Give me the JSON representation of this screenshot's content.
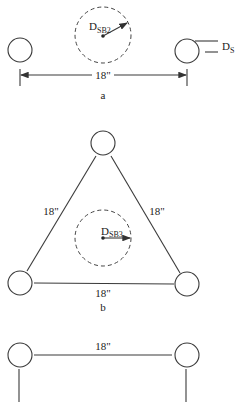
{
  "diagram": {
    "type": "conductor bundle geometry",
    "panels": [
      {
        "id": "a",
        "label": "a",
        "description": "2-conductor bundle",
        "spacing_label": "18\"",
        "gmr_label_main": "D",
        "gmr_label_sub": "SB2",
        "conductor_label_main": "D",
        "conductor_label_sub": "S"
      },
      {
        "id": "b",
        "label": "b",
        "description": "3-conductor bundle (equilateral triangle)",
        "side_labels": [
          "18\"",
          "18\"",
          "18\""
        ],
        "gmr_label_main": "D",
        "gmr_label_sub": "SB3"
      },
      {
        "id": "c",
        "description": "4-conductor bundle (square, partially visible)",
        "top_label": "18\""
      }
    ]
  }
}
